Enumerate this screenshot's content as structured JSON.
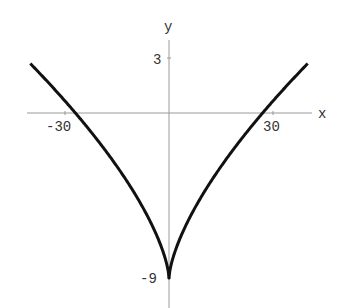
{
  "chart_data": {
    "type": "line",
    "title": "",
    "function": "y = x^(2/3) - 9",
    "xlabel": "x",
    "ylabel": "y",
    "x_ticks": [
      -30,
      30
    ],
    "y_ticks": [
      3,
      -9
    ],
    "x_tick_labels": [
      "-30",
      "30"
    ],
    "y_tick_labels": [
      "3",
      "-9"
    ],
    "xlim": [
      -41,
      41
    ],
    "ylim": [
      -10.6,
      4
    ],
    "grid": false,
    "series": [
      {
        "name": "curve",
        "color": "#111111",
        "x": [
          -40,
          -35,
          -30,
          -27,
          -20,
          -15,
          -10,
          -5,
          -2,
          -1,
          0,
          1,
          2,
          5,
          10,
          15,
          20,
          27,
          30,
          35,
          40
        ],
        "y": [
          2.7,
          1.7,
          0.65,
          0.0,
          -1.63,
          -2.92,
          -4.36,
          -6.08,
          -7.41,
          -8.0,
          -9.0,
          -8.0,
          -7.41,
          -6.08,
          -4.36,
          -2.92,
          -1.63,
          0.0,
          0.65,
          1.7,
          2.7
        ]
      }
    ]
  }
}
